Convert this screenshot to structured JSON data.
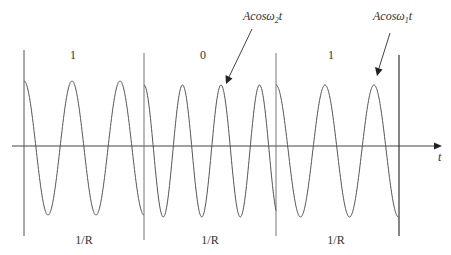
{
  "diagram": {
    "bits": [
      {
        "value": "1",
        "duration_label": "1/R",
        "signal": "Acosω1t"
      },
      {
        "value": "0",
        "duration_label": "1/R",
        "signal": "Acosω2t"
      },
      {
        "value": "1",
        "duration_label": "1/R",
        "signal": "Acosω1t"
      }
    ],
    "annotations": [
      {
        "text_main": "Acos",
        "text_omega": "ω",
        "text_sub": "2",
        "text_t": "t",
        "points_to": "bit-0-segment"
      },
      {
        "text_main": "Acos",
        "text_omega": "ω",
        "text_sub": "1",
        "text_t": "t",
        "points_to": "bit-1-segment-2"
      }
    ],
    "axis": {
      "label": "t"
    },
    "colors": {
      "line": "#444444",
      "wave": "#555555",
      "text": "#333333"
    }
  }
}
